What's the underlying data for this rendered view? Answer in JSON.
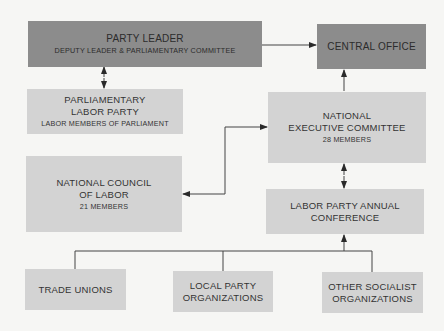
{
  "diagram": {
    "nodes": {
      "party_leader": {
        "title": "PARTY LEADER",
        "subtitle": "DEPUTY LEADER & PARLIAMENTARY COMMITTEE"
      },
      "central_office": {
        "title": "CENTRAL OFFICE"
      },
      "plp": {
        "title_line1": "PARLIAMENTARY",
        "title_line2": "LABOR PARTY",
        "subtitle": "LABOR MEMBERS OF PARLIAMENT"
      },
      "nec": {
        "title_line1": "NATIONAL",
        "title_line2": "EXECUTIVE COMMITTEE",
        "subtitle": "28 MEMBERS"
      },
      "ncl": {
        "title_line1": "NATIONAL COUNCIL",
        "title_line2": "OF LABOR",
        "subtitle": "21 MEMBERS"
      },
      "conference": {
        "title_line1": "LABOR PARTY ANNUAL",
        "title_line2": "CONFERENCE"
      },
      "trade_unions": {
        "title": "TRADE UNIONS"
      },
      "local_party": {
        "title_line1": "LOCAL PARTY",
        "title_line2": "ORGANIZATIONS"
      },
      "other_socialist": {
        "title_line1": "OTHER SOCIALIST",
        "title_line2": "ORGANIZATIONS"
      }
    },
    "edges": [
      {
        "from": "party_leader",
        "to": "central_office",
        "type": "arrow"
      },
      {
        "from": "party_leader",
        "to": "plp",
        "type": "double-arrow"
      },
      {
        "from": "nec",
        "to": "central_office",
        "type": "arrow"
      },
      {
        "from": "ncl",
        "to": "nec",
        "type": "double-arrow"
      },
      {
        "from": "nec",
        "to": "conference",
        "type": "double-arrow"
      },
      {
        "from": "trade_unions",
        "to": "conference",
        "type": "arrow"
      },
      {
        "from": "local_party",
        "to": "conference",
        "type": "arrow"
      },
      {
        "from": "other_socialist",
        "to": "conference",
        "type": "arrow"
      }
    ],
    "colors": {
      "dark_box": "#8c8c8c",
      "light_box": "#d3d3d3",
      "background": "#f6f6f4",
      "line": "#333333"
    }
  }
}
